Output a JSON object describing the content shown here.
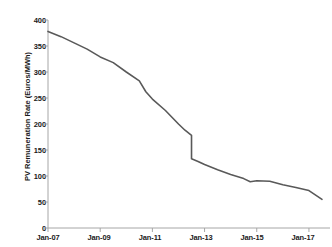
{
  "chart_data": {
    "type": "line",
    "title": "",
    "subtitle": "",
    "xlabel": "",
    "ylabel": "PV Remuneration Rate (Euros/MWh)",
    "ylim": [
      0,
      400
    ],
    "yticks": [
      0,
      50,
      100,
      150,
      200,
      250,
      300,
      350,
      400
    ],
    "ytick_labels": [
      "0",
      "50",
      "100",
      "150",
      "200",
      "250",
      "300",
      "350",
      "400"
    ],
    "xlim": [
      "Jan-07",
      "Jul-17"
    ],
    "xticks": [
      "Jan-07",
      "Jan-09",
      "Jan-11",
      "Jan-13",
      "Jan-15",
      "Jan-17"
    ],
    "xtick_labels": [
      "Jan-07",
      "Jan-09",
      "Jan-11",
      "Jan-13",
      "Jan-15",
      "Jan-17"
    ],
    "grid": false,
    "legend": false,
    "legend_position": "none",
    "line_color": "#595959",
    "axis_color": "#a6a6a6",
    "series": [
      {
        "name": "PV Remuneration Rate",
        "units": "Euros/MWh",
        "x": [
          "Jan-07",
          "Jul-07",
          "Jan-08",
          "Jul-08",
          "Jan-09",
          "Jul-09",
          "Jan-10",
          "Jul-10",
          "Oct-10",
          "Jan-11",
          "Jul-11",
          "Jan-12",
          "Apr-12",
          "Jul-12",
          "Jul-12",
          "Oct-12",
          "Jan-13",
          "Jul-13",
          "Jan-14",
          "Jul-14",
          "Oct-14",
          "Jan-15",
          "Jul-15",
          "Jan-16",
          "Jul-16",
          "Jan-17",
          "Jul-17"
        ],
        "values": [
          378,
          368,
          356,
          344,
          329,
          318,
          300,
          283,
          262,
          248,
          226,
          200,
          188,
          178,
          133,
          128,
          122,
          112,
          103,
          95,
          89,
          91,
          90,
          83,
          78,
          72,
          55
        ]
      }
    ],
    "annotations": [
      {
        "text": "sharp step-down mid-2012 from 178 to 133 Euros/MWh",
        "x": "Jul-12",
        "y": 155
      },
      {
        "text": "plateau near 90 Euros/MWh during 2014-2015",
        "x": "Jan-15",
        "y": 90
      }
    ]
  },
  "axes": {
    "y_label": "PV Remuneration Rate (Euros/MWh)",
    "y_ticks": [
      "400",
      "350",
      "300",
      "250",
      "200",
      "150",
      "100",
      "50",
      "0"
    ],
    "x_ticks": [
      "Jan-07",
      "Jan-09",
      "Jan-11",
      "Jan-13",
      "Jan-15",
      "Jan-17"
    ]
  },
  "colors": {
    "line": "#595959",
    "axis": "#a6a6a6",
    "text": "#1a1a1a",
    "background": "#ffffff"
  }
}
